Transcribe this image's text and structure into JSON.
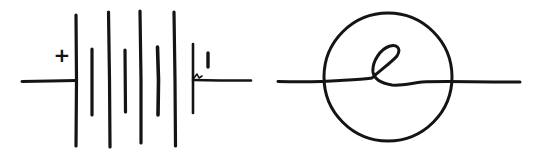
{
  "diagram": {
    "ink_color": "#141414",
    "background": "#ffffff",
    "battery": {
      "name": "battery-symbol",
      "positive_label": "+",
      "negative_label": "I",
      "cells": 4,
      "plates": [
        {
          "type": "long",
          "x": 76,
          "y1": 15,
          "y2": 146
        },
        {
          "type": "short",
          "x": 92,
          "y1": 49,
          "y2": 115
        },
        {
          "type": "long",
          "x": 109,
          "y1": 12,
          "y2": 147
        },
        {
          "type": "short",
          "x": 125,
          "y1": 50,
          "y2": 112
        },
        {
          "type": "long",
          "x": 141,
          "y1": 11,
          "y2": 143
        },
        {
          "type": "short",
          "x": 158,
          "y1": 47,
          "y2": 115
        },
        {
          "type": "long",
          "x": 175,
          "y1": 12,
          "y2": 146
        },
        {
          "type": "short",
          "x": 193,
          "y1": 44,
          "y2": 113
        }
      ],
      "left_lead": {
        "x1": 22,
        "x2": 76,
        "y": 81
      },
      "right_lead": {
        "x1": 193,
        "x2": 251,
        "y": 80
      }
    },
    "lamp": {
      "name": "lamp-symbol",
      "circle": {
        "cx": 388,
        "cy": 77,
        "r": 64
      },
      "lead": {
        "x1": 278,
        "x2": 520,
        "y": 82
      }
    }
  }
}
